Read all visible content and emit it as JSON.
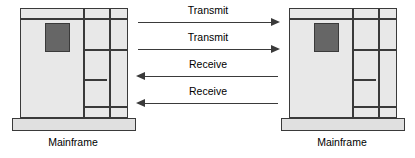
{
  "diagram": {
    "colors": {
      "cabinet_fill": "#e8e8e8",
      "base_fill": "#e0e0e0",
      "panel_fill": "#666666",
      "outline": "#3a3a3a",
      "background": "#ffffff",
      "text": "#000000"
    },
    "nodes": [
      {
        "id": "left-mainframe",
        "caption": "Mainframe",
        "position": "left"
      },
      {
        "id": "right-mainframe",
        "caption": "Mainframe",
        "position": "right"
      }
    ],
    "arrows": [
      {
        "label": "Transmit",
        "direction": "right",
        "from": "left-mainframe",
        "to": "right-mainframe"
      },
      {
        "label": "Transmit",
        "direction": "right",
        "from": "left-mainframe",
        "to": "right-mainframe"
      },
      {
        "label": "Receive",
        "direction": "left",
        "from": "right-mainframe",
        "to": "left-mainframe"
      },
      {
        "label": "Receive",
        "direction": "left",
        "from": "right-mainframe",
        "to": "left-mainframe"
      }
    ]
  }
}
